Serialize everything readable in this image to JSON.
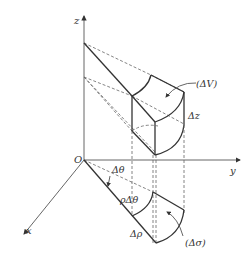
{
  "diagram": {
    "axes": {
      "z_label": "z",
      "y_label": "y",
      "x_label": "x",
      "origin_label": "O"
    },
    "labels": {
      "volume": "(ΔV)",
      "dz": "Δz",
      "dtheta": "Δθ",
      "rho_dtheta": "ρΔθ",
      "drho": "Δρ",
      "area": "(Δσ)"
    },
    "colors": {
      "line": "#333333",
      "dashed": "#666666",
      "background": "#ffffff"
    }
  }
}
